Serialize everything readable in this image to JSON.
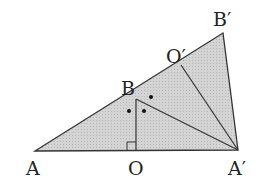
{
  "diagram": {
    "type": "geometry",
    "fill_color": "#cfcfcf",
    "stroke_color": "#333333",
    "points": {
      "A": {
        "label": "A",
        "x": 35,
        "y": 151
      },
      "O": {
        "label": "O",
        "x": 136,
        "y": 151
      },
      "B": {
        "label": "B",
        "x": 136,
        "y": 99
      },
      "Ap": {
        "label": "A′",
        "x": 238,
        "y": 150
      },
      "Bp": {
        "label": "B′",
        "x": 223,
        "y": 33
      },
      "Op": {
        "label": "O′",
        "x": 181,
        "y": 65
      }
    },
    "segments": [
      "A-Bp",
      "Bp-Ap",
      "A-Ap",
      "B-O",
      "B-Ap",
      "Op-Ap"
    ],
    "right_angle_at": "O",
    "angle_marks": "dots"
  }
}
